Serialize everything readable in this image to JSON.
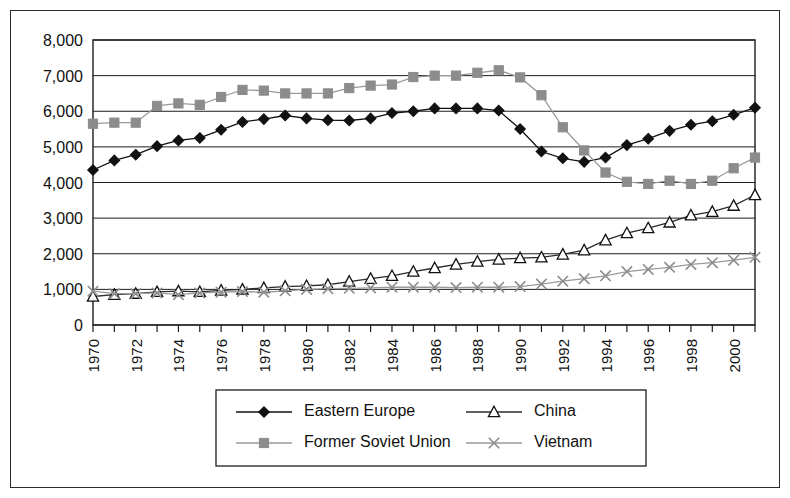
{
  "chart_data": {
    "type": "line",
    "title": "",
    "subtitle": "",
    "xlabel": "",
    "ylabel": "",
    "xlim": [
      1970,
      2001
    ],
    "ylim": [
      0,
      8000
    ],
    "grid": true,
    "grid_axis": "y",
    "legend_position": "bottom",
    "legend_columns": 2,
    "x": [
      1970,
      1971,
      1972,
      1973,
      1974,
      1975,
      1976,
      1977,
      1978,
      1979,
      1980,
      1981,
      1982,
      1983,
      1984,
      1985,
      1986,
      1987,
      1988,
      1989,
      1990,
      1991,
      1992,
      1993,
      1994,
      1995,
      1996,
      1997,
      1998,
      1999,
      2000,
      2001
    ],
    "y_ticks": [
      0,
      1000,
      2000,
      3000,
      4000,
      5000,
      6000,
      7000,
      8000
    ],
    "y_tick_labels": [
      "0",
      "1,000",
      "2,000",
      "3,000",
      "4,000",
      "5,000",
      "6,000",
      "7,000",
      "8,000"
    ],
    "x_tick_labels": [
      "1970",
      "",
      "1972",
      "",
      "1974",
      "",
      "1976",
      "",
      "1978",
      "",
      "1980",
      "",
      "1982",
      "",
      "1984",
      "",
      "1986",
      "",
      "1988",
      "",
      "1990",
      "",
      "1992",
      "",
      "1994",
      "",
      "1996",
      "",
      "1998",
      "",
      "2000",
      ""
    ],
    "x_tick_labels_visible": [
      "1970",
      "1972",
      "1974",
      "1976",
      "1978",
      "1980",
      "1982",
      "1984",
      "1986",
      "1988",
      "1990",
      "1992",
      "1994",
      "1996",
      "1998",
      "2000"
    ],
    "series": [
      {
        "name": "Eastern Europe",
        "marker": "diamond",
        "marker_filled": true,
        "color": "#111111",
        "line_color": "#111111",
        "values": [
          4350,
          4620,
          4780,
          5020,
          5180,
          5250,
          5480,
          5700,
          5780,
          5880,
          5800,
          5750,
          5740,
          5800,
          5950,
          6000,
          6080,
          6080,
          6080,
          6020,
          5500,
          4870,
          4680,
          4580,
          4700,
          5050,
          5230,
          5450,
          5620,
          5720,
          5900,
          6100
        ]
      },
      {
        "name": "Former Soviet Union",
        "marker": "square",
        "marker_filled": true,
        "color": "#8c8c8c",
        "line_color": "#9a9a9a",
        "values": [
          5650,
          5680,
          5680,
          6150,
          6220,
          6180,
          6400,
          6600,
          6580,
          6500,
          6500,
          6500,
          6650,
          6720,
          6750,
          6960,
          7000,
          7000,
          7080,
          7150,
          6950,
          6450,
          5550,
          4900,
          4280,
          4020,
          3960,
          4050,
          3960,
          4050,
          4400,
          4700
        ]
      },
      {
        "name": "China",
        "marker": "triangle",
        "marker_filled": false,
        "color": "#111111",
        "line_color": "#2b2b2b",
        "values": [
          800,
          850,
          880,
          930,
          950,
          930,
          970,
          1000,
          1040,
          1080,
          1100,
          1130,
          1220,
          1300,
          1380,
          1500,
          1600,
          1700,
          1780,
          1840,
          1880,
          1900,
          1980,
          2100,
          2380,
          2580,
          2720,
          2880,
          3080,
          3180,
          3350,
          3650
        ]
      },
      {
        "name": "Vietnam",
        "marker": "cross",
        "marker_filled": false,
        "color": "#8c8c8c",
        "line_color": "#9a9a9a",
        "values": [
          950,
          880,
          880,
          900,
          850,
          900,
          920,
          940,
          920,
          960,
          1000,
          1020,
          1030,
          1040,
          1060,
          1060,
          1060,
          1050,
          1060,
          1060,
          1080,
          1150,
          1230,
          1300,
          1380,
          1500,
          1560,
          1620,
          1700,
          1750,
          1820,
          1900
        ]
      }
    ]
  },
  "legend": {
    "entries": [
      {
        "label": "Eastern Europe"
      },
      {
        "label": "China"
      },
      {
        "label": "Former Soviet Union"
      },
      {
        "label": "Vietnam"
      }
    ]
  },
  "colors": {
    "dark": "#111111",
    "gray": "#8c8c8c",
    "frame": "#2b2b2b",
    "background": "#ffffff"
  }
}
